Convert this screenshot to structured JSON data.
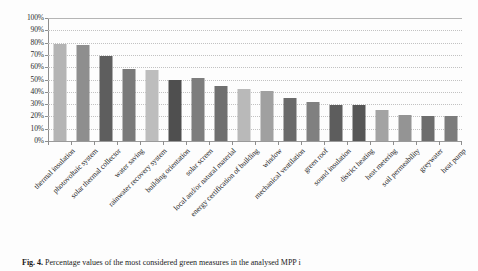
{
  "caption": {
    "label": "Fig. 4.",
    "text": "Percentage values of the most considered green measures in the analysed MPP i"
  },
  "chart_data": {
    "type": "bar",
    "title": "",
    "xlabel": "",
    "ylabel": "",
    "ylim": [
      0,
      100
    ],
    "grid": true,
    "legend": "none",
    "ytick_labels": [
      "100%",
      "90%",
      "80%",
      "70%",
      "60%",
      "50%",
      "40%",
      "30%",
      "20%",
      "10%",
      "0%"
    ],
    "ytick_values": [
      100,
      90,
      80,
      70,
      60,
      50,
      40,
      30,
      20,
      10,
      0
    ],
    "categories": [
      "thermal insulation",
      "photovoltaic system",
      "solar thermal collector",
      "water saving",
      "rainwater recovery system",
      "building orientation",
      "solar screen",
      "local and/or natural material",
      "energy certification of building",
      "window",
      "mechanical ventilation",
      "green roof",
      "sound insulation",
      "district heating",
      "heat metering",
      "soil permeability",
      "greywater",
      "heat pump"
    ],
    "values": [
      79,
      78,
      69.5,
      58.5,
      57.5,
      49.5,
      51,
      44.5,
      42.5,
      41,
      35,
      31.5,
      29.5,
      29.5,
      25,
      21,
      20,
      20
    ],
    "bar_colors": [
      "#b4b4b4",
      "#8e8e8e",
      "#5e5e5e",
      "#7a7a7a",
      "#bdbdbd",
      "#4f4f4f",
      "#7d7d7d",
      "#6f6f6f",
      "#b9b9b9",
      "#a0a0a0",
      "#6a6a6a",
      "#808080",
      "#5d5d5d",
      "#565656",
      "#a3a3a3",
      "#949494",
      "#6d6d6d",
      "#7c7c7c"
    ],
    "axis_color": "#8e8e8e",
    "gridline_color": "#c2c2c2"
  }
}
